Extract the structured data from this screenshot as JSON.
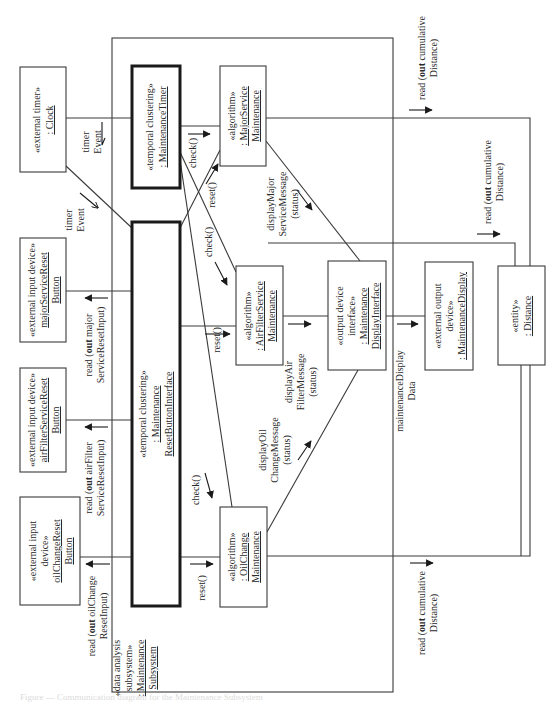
{
  "diagram": {
    "type": "UML communication diagram",
    "orientation": "rotated 90 degrees counter-clockwise",
    "subsystem": {
      "stereotype_1": "«data analysis",
      "stereotype_2": "subsystem»",
      "name_1": ": Maintenance",
      "name_2": "Subsystem"
    },
    "objects": {
      "clock": {
        "stereotype": "«external timer»",
        "name": ": Clock"
      },
      "maintenance_timer": {
        "stereotype": "«temporal clustering»",
        "name": ": MaintenanceTimer"
      },
      "major_service": {
        "stereotype": "«algorithm»",
        "name_1": ": MajorService",
        "name_2": "Maintenance"
      },
      "major_reset_button": {
        "stereotype": "«external input device»",
        "name_1": "majorServiceReset",
        "name_2": "Button"
      },
      "air_filter_reset_button": {
        "stereotype": "«external input device»",
        "name_1": "airFilterServiceReset",
        "name_2": "Button"
      },
      "oil_change_reset_button": {
        "stereotype_1": "«external input",
        "stereotype_2": "device»",
        "name_1": "oilChangeReset",
        "name_2": "Button"
      },
      "reset_button_interface": {
        "stereotype": "«temporal clustering»",
        "name_1": ": Maintenance",
        "name_2": "ResetButtonInterface"
      },
      "air_filter_service": {
        "stereotype": "«algorithm»",
        "name_1": ": AirFilterService",
        "name_2": "Maintenance"
      },
      "oil_change": {
        "stereotype": "«algorithm»",
        "name_1": ": OilChange",
        "name_2": "Maintenance"
      },
      "display_interface": {
        "stereotype_1": "«output device",
        "stereotype_2": "interface»",
        "name_1": ": Maintenance",
        "name_2": "DisplayInterface"
      },
      "maintenance_display": {
        "stereotype_1": "«external output",
        "stereotype_2": "device»",
        "name": ": MaintenanceDisplay"
      },
      "distance": {
        "stereotype": "«entity»",
        "name": ": Distance"
      }
    },
    "messages": {
      "timer_event_1": {
        "line_1": "timer",
        "line_2": "Event"
      },
      "timer_event_2": {
        "line_1": "timer",
        "line_2": "Event"
      },
      "check_major": "check()",
      "reset_major": "reset()",
      "check_air": "check()",
      "reset_air": "reset()",
      "check_oil": "check()",
      "reset_oil": "reset()",
      "display_major": {
        "line_1": "displayMajor",
        "line_2": "ServiceMessage",
        "line_3": "(status)"
      },
      "display_air": {
        "line_1": "displayAir",
        "line_2": "FilterMessage",
        "line_3": "(status)"
      },
      "display_oil": {
        "line_1": "displayOil",
        "line_2": "ChangeMessage",
        "line_3": "(status)"
      },
      "maintenance_display_data": {
        "line_1": "maintenanceDisplay",
        "line_2": "Data"
      },
      "read_major": {
        "prefix": "read (",
        "keyword": "out",
        "rest": " major",
        "line_2": "ServiceResetInput)"
      },
      "read_air": {
        "prefix": "read (",
        "keyword": "out",
        "rest": " airFilter",
        "line_2": "ServiceResetInput)"
      },
      "read_oil": {
        "prefix": "read (",
        "keyword": "out",
        "rest": " oilChange",
        "line_2": "ResetInput)"
      },
      "read_distance_top": {
        "prefix": "read (",
        "keyword": "out",
        "rest": " cumulative",
        "line_2": "Distance)"
      },
      "read_distance_mid": {
        "prefix": "read (",
        "keyword": "out",
        "rest": " cumulative",
        "line_2": "Distance)"
      },
      "read_distance_bottom": {
        "prefix": "read (",
        "keyword": "out",
        "rest": " cumulative",
        "line_2": "Distance)"
      }
    },
    "caption": "Figure — Communication diagram for the Maintenance Subsystem"
  }
}
